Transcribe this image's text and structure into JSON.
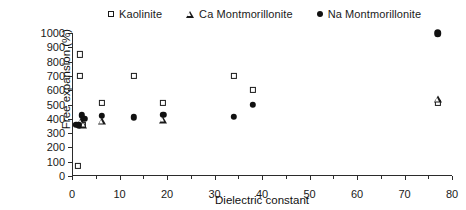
{
  "chart_data": {
    "type": "scatter",
    "title": "",
    "xlabel": "Dielectric constant",
    "ylabel": "Free expansion (%)",
    "xlim": [
      0,
      80
    ],
    "ylim": [
      0,
      1000
    ],
    "xticks": [
      0,
      10,
      20,
      30,
      40,
      50,
      60,
      70,
      80
    ],
    "yticks": [
      0,
      100,
      200,
      300,
      400,
      500,
      600,
      700,
      800,
      900,
      1000
    ],
    "xtick_labels": [
      "0",
      "10",
      "20",
      "30",
      "40",
      "50",
      "60",
      "70",
      "80"
    ],
    "ytick_labels": [
      "0",
      "100",
      "200",
      "300",
      "400",
      "500",
      "600",
      "700",
      "800",
      "900",
      "1000"
    ],
    "grid": false,
    "legend_position": "top-center",
    "series": [
      {
        "name": "Kaolinite",
        "marker": "open-square",
        "points": [
          {
            "x": 1.2,
            "y": 70
          },
          {
            "x": 1.6,
            "y": 850
          },
          {
            "x": 1.6,
            "y": 700
          },
          {
            "x": 2.2,
            "y": 360
          },
          {
            "x": 6.3,
            "y": 510
          },
          {
            "x": 13.0,
            "y": 700
          },
          {
            "x": 19.2,
            "y": 510
          },
          {
            "x": 34.0,
            "y": 700
          },
          {
            "x": 38.0,
            "y": 600
          },
          {
            "x": 77.0,
            "y": 510
          }
        ]
      },
      {
        "name": "Ca Montmorillonite",
        "marker": "open-triangle",
        "points": [
          {
            "x": 1.9,
            "y": 385
          },
          {
            "x": 2.4,
            "y": 360
          },
          {
            "x": 6.3,
            "y": 385
          },
          {
            "x": 19.2,
            "y": 395
          },
          {
            "x": 77.0,
            "y": 540
          }
        ]
      },
      {
        "name": "Na Montmorillonite",
        "marker": "filled-circle",
        "points": [
          {
            "x": 0.9,
            "y": 360
          },
          {
            "x": 1.4,
            "y": 355
          },
          {
            "x": 2.0,
            "y": 425
          },
          {
            "x": 2.6,
            "y": 400
          },
          {
            "x": 6.3,
            "y": 420
          },
          {
            "x": 13.0,
            "y": 410
          },
          {
            "x": 19.2,
            "y": 430
          },
          {
            "x": 34.0,
            "y": 415
          },
          {
            "x": 38.0,
            "y": 500
          },
          {
            "x": 77.0,
            "y": 1000
          }
        ]
      }
    ]
  },
  "legend": {
    "items": [
      {
        "label": "Kaolinite",
        "marker": "open-square",
        "icon": "square-icon"
      },
      {
        "label": "Ca Montmorillonite",
        "marker": "open-triangle",
        "icon": "triangle-icon"
      },
      {
        "label": "Na Montmorillonite",
        "marker": "filled-circle",
        "icon": "circle-icon"
      }
    ]
  },
  "colors": {
    "axis": "#2b2b2b",
    "marker": "#111111",
    "background": "#ffffff"
  }
}
